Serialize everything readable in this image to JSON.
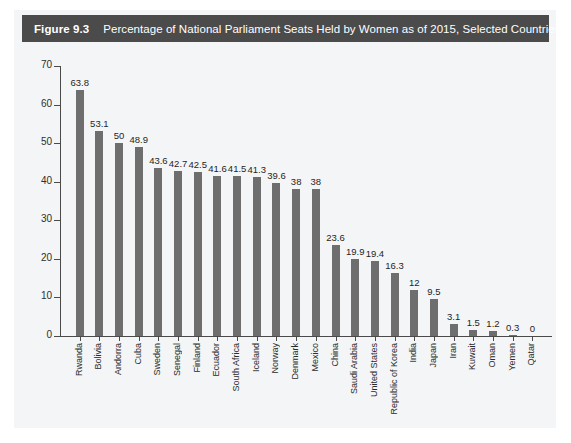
{
  "figure": {
    "number_label": "Figure 9.3",
    "caption": "Percentage of National Parliament Seats Held by Women as of 2015, Selected Countries"
  },
  "colors": {
    "title_bar_bg": "#4b4b4b",
    "title_bar_text": "#ffffff",
    "bar_fill": "#6e6e6e",
    "axis": "#4a4a4a",
    "panel_bg": "#f4f5f6"
  },
  "chart_data": {
    "type": "bar",
    "title": "Percentage of National Parliament Seats Held by Women as of 2015, Selected Countries",
    "xlabel": "",
    "ylabel": "",
    "ylim": [
      0,
      70
    ],
    "yticks": [
      0,
      10,
      20,
      30,
      40,
      50,
      60,
      70
    ],
    "ytick_labels": [
      "0",
      "10",
      "20",
      "30",
      "40",
      "50",
      "60",
      "70"
    ],
    "grid": false,
    "legend": false,
    "value_labels_shown": true,
    "categories": [
      "Rwanda",
      "Bolivia",
      "Andorra",
      "Cuba",
      "Sweden",
      "Senegal",
      "Finland",
      "Ecuador",
      "South Africa",
      "Iceland",
      "Norway",
      "Denmark",
      "Mexico",
      "China",
      "Saudi Arabia",
      "United States",
      "Republic of Korea",
      "India",
      "Japan",
      "Iran",
      "Kuwait",
      "Oman",
      "Yemen",
      "Qatar"
    ],
    "values": [
      63.8,
      53.1,
      50,
      48.9,
      43.6,
      42.7,
      42.5,
      41.6,
      41.5,
      41.3,
      39.6,
      38,
      38,
      23.6,
      19.9,
      19.4,
      16.3,
      12,
      9.5,
      3.1,
      1.5,
      1.2,
      0.3,
      0
    ],
    "value_label_texts": [
      "63.8",
      "53.1",
      "50",
      "48.9",
      "43.6",
      "42.7",
      "42.5",
      "41.6",
      "41.5",
      "41.3",
      "39.6",
      "38",
      "38",
      "23.6",
      "19.9",
      "19.4",
      "16.3",
      "12",
      "9.5",
      "3.1",
      "1.5",
      "1.2",
      "0.3",
      "0"
    ]
  }
}
